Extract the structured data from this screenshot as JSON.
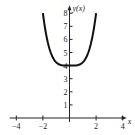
{
  "chart_data": {
    "type": "line",
    "title": "",
    "function": "y = x^4/4 + 4",
    "xlabel": "x",
    "ylabel": "y(x)",
    "xlim": [
      -4.5,
      4.3
    ],
    "ylim": [
      0,
      8.6
    ],
    "x_ticks": [
      -4,
      -2,
      2,
      4
    ],
    "x_tick_labels": [
      "-4",
      "-2",
      "2",
      "4"
    ],
    "y_ticks": [
      1,
      2,
      3,
      4,
      5,
      6,
      7,
      8
    ],
    "y_tick_labels": [
      "1",
      "2",
      "3",
      "4",
      "5",
      "6",
      "7",
      "8"
    ],
    "grid": false,
    "series": [
      {
        "name": "y(x)",
        "x": [
          -2,
          -1.75,
          -1.5,
          -1.25,
          -1,
          -0.75,
          -0.5,
          -0.25,
          0,
          0.25,
          0.5,
          0.75,
          1,
          1.25,
          1.5,
          1.75,
          2
        ],
        "y": [
          8,
          6.35,
          5.27,
          4.61,
          4.25,
          4.08,
          4.02,
          4.0,
          4,
          4.0,
          4.02,
          4.08,
          4.25,
          4.61,
          5.27,
          6.35,
          8
        ]
      }
    ],
    "colors": {
      "curve": "#111111",
      "axes": "#222222"
    }
  }
}
